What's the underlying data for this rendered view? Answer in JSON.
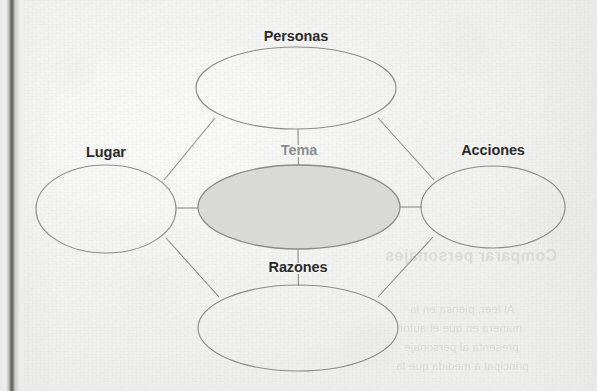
{
  "page": {
    "width": 597,
    "height": 391,
    "background_color": "#f4f4f2",
    "medium": "scanned-book-page"
  },
  "colors": {
    "paper": "#f4f4f2",
    "ellipse_stroke": "#8c8c88",
    "connector_stroke": "#8c8c88",
    "center_fill": "#d9d9d6",
    "label_text": "#2b2b2b",
    "center_label_text": "#8d8d8a",
    "binding_line": "#595957",
    "bleed_text": "#cfcfcb"
  },
  "diagram": {
    "type": "concept-map",
    "name": "mapa-de-ideas",
    "language": "es",
    "center": {
      "id": "tema",
      "label": "Tema",
      "label_position": "above-inside",
      "filled": true,
      "fill_color": "#d9d9d6",
      "cx": 299,
      "cy": 207,
      "rx": 101,
      "ry": 42
    },
    "satellites": [
      {
        "id": "personas",
        "label": "Personas",
        "position": "top",
        "filled": false,
        "cx": 296,
        "cy": 88,
        "rx": 100,
        "ry": 41,
        "label_x": 296,
        "label_y": 28
      },
      {
        "id": "lugar",
        "label": "Lugar",
        "position": "left",
        "filled": false,
        "cx": 106,
        "cy": 209,
        "rx": 70,
        "ry": 44,
        "label_x": 106,
        "label_y": 144
      },
      {
        "id": "acciones",
        "label": "Acciones",
        "position": "right",
        "filled": false,
        "cx": 493,
        "cy": 207,
        "rx": 72,
        "ry": 41,
        "label_x": 493,
        "label_y": 142
      },
      {
        "id": "razones",
        "label": "Razones",
        "position": "bottom",
        "filled": false,
        "cx": 298,
        "cy": 328,
        "rx": 100,
        "ry": 43,
        "label_x": 298,
        "label_y": 259
      }
    ],
    "connectors": [
      {
        "id": "tema-personas",
        "from": "tema",
        "to": "personas",
        "kind": "vertical"
      },
      {
        "id": "tema-razones",
        "from": "tema",
        "to": "razones",
        "kind": "vertical"
      },
      {
        "id": "tema-lugar",
        "from": "tema",
        "to": "lugar",
        "kind": "horizontal"
      },
      {
        "id": "tema-acciones",
        "from": "tema",
        "to": "acciones",
        "kind": "horizontal"
      },
      {
        "id": "personas-lugar",
        "from": "personas",
        "to": "lugar",
        "kind": "diagonal"
      },
      {
        "id": "personas-acciones",
        "from": "personas",
        "to": "acciones",
        "kind": "diagonal"
      },
      {
        "id": "lugar-razones",
        "from": "lugar",
        "to": "razones",
        "kind": "diagonal"
      },
      {
        "id": "acciones-razones",
        "from": "acciones",
        "to": "razones",
        "kind": "diagonal"
      }
    ]
  },
  "bleed_through": {
    "description": "faint mirrored show-through text from the reverse side of the page",
    "heading": "Comparar personajes",
    "lines": [
      "Al leer, piensa en la",
      "manera en que el autor",
      "presenta al personaje",
      "principal a medida que la"
    ]
  }
}
